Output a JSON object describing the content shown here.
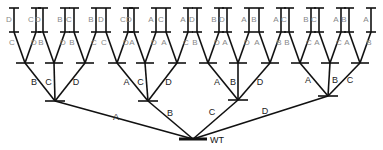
{
  "diagram": {
    "type": "tree",
    "root": {
      "label": "WT",
      "x": 193,
      "y": 139
    },
    "level1": [
      {
        "edge_label": "A",
        "x": 55,
        "y": 101,
        "label_pos": [
          116,
          120
        ]
      },
      {
        "edge_label": "B",
        "x": 148,
        "y": 101,
        "label_pos": [
          170,
          116
        ]
      },
      {
        "edge_label": "C",
        "x": 238,
        "y": 100,
        "label_pos": [
          212,
          115
        ]
      },
      {
        "edge_label": "D",
        "x": 328,
        "y": 96,
        "label_pos": [
          265,
          114
        ]
      }
    ],
    "level2": [
      {
        "parent": 0,
        "edge_label": "B",
        "x": 25,
        "y": 63,
        "children": [
          "C",
          "D"
        ],
        "leaves": [
          "D",
          "C"
        ]
      },
      {
        "parent": 0,
        "edge_label": "C",
        "x": 54,
        "y": 63,
        "children": [
          "B",
          "D"
        ],
        "leaves": [
          "D",
          "B"
        ]
      },
      {
        "parent": 0,
        "edge_label": "D",
        "x": 85,
        "y": 63,
        "children": [
          "B",
          "C"
        ],
        "leaves": [
          "C",
          "B"
        ]
      },
      {
        "parent": 1,
        "edge_label": "A",
        "x": 117,
        "y": 63,
        "children": [
          "C",
          "D"
        ],
        "leaves": [
          "D",
          "C"
        ]
      },
      {
        "parent": 1,
        "edge_label": "C",
        "x": 145,
        "y": 63,
        "children": [
          "A",
          "D"
        ],
        "leaves": [
          "D",
          "A"
        ]
      },
      {
        "parent": 1,
        "edge_label": "D",
        "x": 177,
        "y": 63,
        "children": [
          "A",
          "C"
        ],
        "leaves": [
          "C",
          "A"
        ]
      },
      {
        "parent": 2,
        "edge_label": "A",
        "x": 208,
        "y": 63,
        "children": [
          "B",
          "D"
        ],
        "leaves": [
          "D",
          "B"
        ]
      },
      {
        "parent": 2,
        "edge_label": "B",
        "x": 238,
        "y": 63,
        "children": [
          "A",
          "D"
        ],
        "leaves": [
          "D",
          "A"
        ]
      },
      {
        "parent": 2,
        "edge_label": "D",
        "x": 270,
        "y": 63,
        "children": [
          "A",
          "B"
        ],
        "leaves": [
          "B",
          "A"
        ]
      },
      {
        "parent": 3,
        "edge_label": "A",
        "x": 300,
        "y": 63,
        "children": [
          "B",
          "C"
        ],
        "leaves": [
          "C",
          "B"
        ]
      },
      {
        "parent": 3,
        "edge_label": "B",
        "x": 330,
        "y": 63,
        "children": [
          "A",
          "C"
        ],
        "leaves": [
          "C",
          "A"
        ]
      },
      {
        "parent": 3,
        "edge_label": "C",
        "x": 360,
        "y": 63,
        "children": [
          "A",
          "B"
        ],
        "leaves": [
          "B",
          "A"
        ]
      }
    ]
  }
}
